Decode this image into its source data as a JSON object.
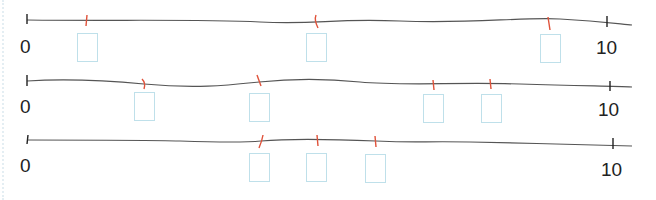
{
  "diagram": {
    "type": "number-line-worksheet",
    "colors": {
      "line": "#555555",
      "end_tick": "#222222",
      "mark_tick": "#e0523a",
      "answer_box_border": "#bfe0ea"
    },
    "rows": [
      {
        "start_label": "0",
        "end_label": "10",
        "marks": [
          1,
          5,
          9
        ],
        "answer_boxes": [
          "",
          "",
          ""
        ]
      },
      {
        "start_label": "0",
        "end_label": "10",
        "marks": [
          2,
          4,
          7,
          8
        ],
        "answer_boxes": [
          "",
          "",
          "",
          ""
        ]
      },
      {
        "start_label": "0",
        "end_label": "10",
        "marks": [
          4,
          5,
          6
        ],
        "answer_boxes": [
          "",
          "",
          ""
        ]
      }
    ]
  }
}
